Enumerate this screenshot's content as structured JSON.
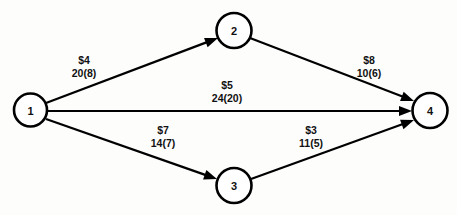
{
  "diagram": {
    "background_color": "#fdfdfc",
    "stroke_color": "#000000",
    "node_fill_color": "#ffffff",
    "nodes": [
      {
        "id": "1",
        "label": "1",
        "cx": 30.5,
        "cy": 110,
        "r": 16.5
      },
      {
        "id": "2",
        "label": "2",
        "cx": 234,
        "cy": 30.5,
        "r": 17.5
      },
      {
        "id": "3",
        "label": "3",
        "cx": 234,
        "cy": 185.5,
        "r": 17.5
      },
      {
        "id": "4",
        "label": "4",
        "cx": 430,
        "cy": 110.5,
        "r": 17.5
      }
    ],
    "edges": [
      {
        "id": "edge-1-2",
        "from": "1",
        "to": "2",
        "cost": "$4",
        "capacity": "20(8)",
        "cost_value": 4,
        "capacity_value": 20,
        "flow_value": 8,
        "x1": 46,
        "y1": 103,
        "x2": 218,
        "y2": 38,
        "label_x": 84,
        "label_y": 64
      },
      {
        "id": "edge-2-4",
        "from": "2",
        "to": "4",
        "cost": "$8",
        "capacity": "10(6)",
        "cost_value": 8,
        "capacity_value": 10,
        "flow_value": 6,
        "x1": 250,
        "y1": 38,
        "x2": 414,
        "y2": 101,
        "label_x": 369,
        "label_y": 64
      },
      {
        "id": "edge-1-4",
        "from": "1",
        "to": "4",
        "cost": "$5",
        "capacity": "24(20)",
        "cost_value": 5,
        "capacity_value": 24,
        "flow_value": 20,
        "x1": 47,
        "y1": 111,
        "x2": 412,
        "y2": 111,
        "label_x": 227,
        "label_y": 89
      },
      {
        "id": "edge-1-3",
        "from": "1",
        "to": "3",
        "cost": "$7",
        "capacity": "14(7)",
        "cost_value": 7,
        "capacity_value": 14,
        "flow_value": 7,
        "x1": 46,
        "y1": 119,
        "x2": 217,
        "y2": 179,
        "label_x": 163,
        "label_y": 134
      },
      {
        "id": "edge-3-4",
        "from": "3",
        "to": "4",
        "cost": "$3",
        "capacity": "11(5)",
        "cost_value": 3,
        "capacity_value": 11,
        "flow_value": 5,
        "x1": 251,
        "y1": 179,
        "x2": 414,
        "y2": 120,
        "label_x": 311,
        "label_y": 134
      }
    ]
  }
}
